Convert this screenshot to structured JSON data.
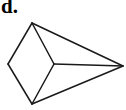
{
  "label": "d.",
  "figure": {
    "stroke_color": "#1a1a1a",
    "vertices": {
      "A": [
        32,
        23
      ],
      "B": [
        8,
        64
      ],
      "C": [
        32,
        104
      ],
      "D": [
        54,
        64
      ],
      "E": [
        123,
        66
      ]
    },
    "edges": [
      [
        "A",
        "B"
      ],
      [
        "B",
        "C"
      ],
      [
        "A",
        "D"
      ],
      [
        "D",
        "C"
      ],
      [
        "A",
        "E"
      ],
      [
        "C",
        "E"
      ],
      [
        "D",
        "E"
      ]
    ]
  }
}
